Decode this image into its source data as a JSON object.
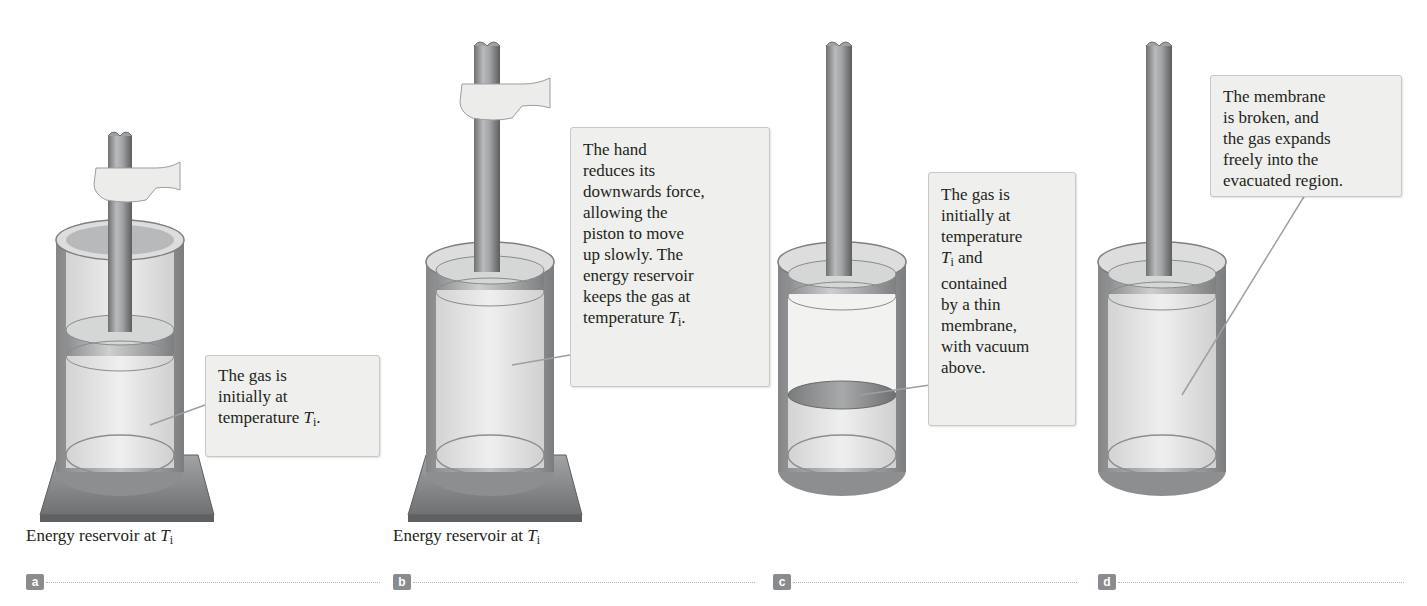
{
  "figure": {
    "panels": [
      {
        "id": "a",
        "label": "a",
        "callout": {
          "lines": [
            "The gas is",
            "initially at",
            "temperature "
          ],
          "symbol": "T",
          "subscript": "i",
          "suffix": "."
        },
        "caption": {
          "text": "Energy reservoir at ",
          "symbol": "T",
          "subscript": "i"
        }
      },
      {
        "id": "b",
        "label": "b",
        "callout": {
          "lines": [
            "The hand",
            "reduces its",
            "downwards force,",
            "allowing the",
            "piston to move",
            "up slowly. The",
            "energy reservoir",
            "keeps the gas at",
            "temperature "
          ],
          "symbol": "T",
          "subscript": "i",
          "suffix": "."
        },
        "caption": {
          "text": "Energy reservoir at ",
          "symbol": "T",
          "subscript": "i"
        }
      },
      {
        "id": "c",
        "label": "c",
        "callout": {
          "lines": [
            "The gas is",
            "initially at",
            "temperature",
            "",
            "contained",
            "by a thin",
            "membrane,",
            "with vacuum",
            "above."
          ],
          "symbol": "T",
          "subscript": "i",
          "symbol_suffix": " and"
        }
      },
      {
        "id": "d",
        "label": "d",
        "callout": {
          "lines": [
            "The membrane",
            "is broken, and",
            "the gas expands",
            "freely into the",
            "evacuated region."
          ]
        }
      }
    ],
    "colors": {
      "callout_bg": "#efefed",
      "callout_border": "#c9c8c4",
      "cylinder_gray": "#9a9b9d",
      "reservoir_gray": "#8f8f8f",
      "gas_fill": "#e3e4e3",
      "hand_fill": "#ececea",
      "label_bg": "#8a8b8c",
      "leader_line": "#9aa0a6"
    }
  }
}
